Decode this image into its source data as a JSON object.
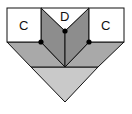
{
  "diagram": {
    "labels": {
      "left_square": "C",
      "center_triangle": "D",
      "right_square": "C"
    },
    "colors": {
      "white": "#ffffff",
      "light_gray": "#c9c9c9",
      "mid_gray": "#a9a9a9",
      "dark_gray": "#8d8d8d",
      "stroke": "#111111"
    },
    "points": {
      "center_dot": [
        65,
        31
      ],
      "left_dot": [
        41,
        42
      ],
      "right_dot": [
        89,
        42
      ]
    }
  }
}
